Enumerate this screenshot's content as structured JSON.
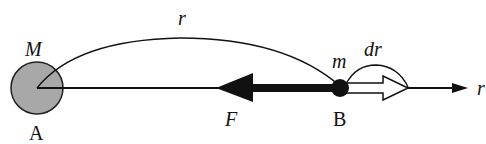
{
  "diagram": {
    "labels": {
      "mass_big": "M",
      "point_a": "A",
      "distance": "r",
      "force": "F",
      "point_b": "B",
      "mass_small": "m",
      "displacement": "dr",
      "axis": "r"
    },
    "colors": {
      "big_mass_fill": "#a8a8a8",
      "stroke": "#111111",
      "small_mass_fill": "#111111",
      "hollow_arrow_fill": "#ffffff"
    }
  }
}
